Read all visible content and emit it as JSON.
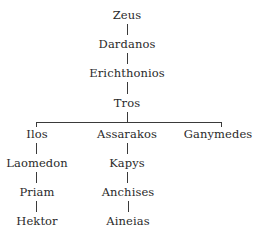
{
  "diagram": {
    "type": "family-tree",
    "trunk": [
      "Zeus",
      "Dardanos",
      "Erichthonios",
      "Tros"
    ],
    "branches": [
      {
        "root": "Ilos",
        "descendants": [
          "Laomedon",
          "Priam",
          "Hektor"
        ]
      },
      {
        "root": "Assarakos",
        "descendants": [
          "Kapys",
          "Anchises",
          "Aineias"
        ]
      },
      {
        "root": "Ganymedes",
        "descendants": []
      }
    ]
  },
  "nodes": {
    "zeus": "Zeus",
    "dardanos": "Dardanos",
    "erichthonios": "Erichthonios",
    "tros": "Tros",
    "ilos": "Ilos",
    "laomedon": "Laomedon",
    "priam": "Priam",
    "hektor": "Hektor",
    "assarakos": "Assarakos",
    "kapys": "Kapys",
    "anchises": "Anchises",
    "aineias": "Aineias",
    "ganymedes": "Ganymedes"
  }
}
